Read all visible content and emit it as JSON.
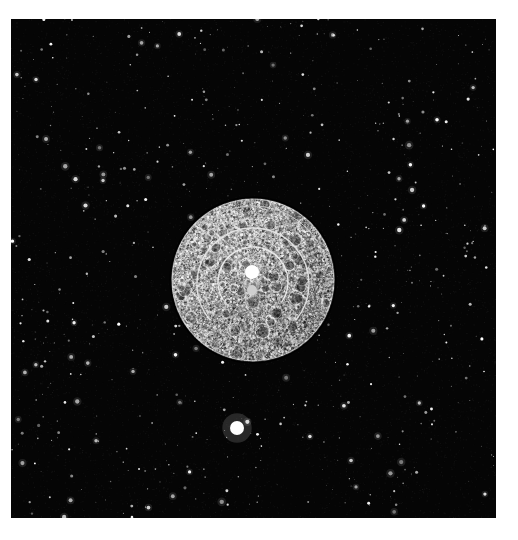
{
  "page": {
    "width": 518,
    "height": 540,
    "background_color": "#ffffff",
    "media_type": "halftone-printed astronomical photograph",
    "caption": ""
  },
  "plate": {
    "name": "moon-star-field-plate",
    "x": 11,
    "y": 19,
    "width": 485,
    "height": 499,
    "sky_color": "#050505",
    "border_color": "#ffffff"
  },
  "scene": {
    "title": "The Moon over a dense star field",
    "objects": [
      {
        "name": "moon",
        "type": "disc",
        "cx": 253,
        "cy": 280,
        "radius": 82,
        "surface": "cratered halftone grayscale",
        "highlight_color": "#e8e8e8",
        "shadow_color": "#2a2a2a"
      },
      {
        "name": "bright-central-spot",
        "type": "dot",
        "cx": 252,
        "cy": 272,
        "radius": 7,
        "color": "#ffffff"
      },
      {
        "name": "secondary-spot",
        "type": "dot",
        "cx": 252,
        "cy": 290,
        "radius": 5,
        "color": "#cfcfcf"
      },
      {
        "name": "bright-object-below-moon",
        "type": "dot",
        "cx": 237,
        "cy": 428,
        "radius": 7,
        "color": "#ffffff"
      }
    ],
    "arcs": [
      {
        "name": "inner-arc",
        "cx": 253,
        "cy": 282,
        "radius": 35,
        "start_deg": 150,
        "end_deg": 395,
        "color": "#f0f0f0",
        "width": 1.4
      },
      {
        "name": "mid-arc",
        "cx": 253,
        "cy": 284,
        "radius": 56,
        "start_deg": 140,
        "end_deg": 400,
        "color": "#e6e6e6",
        "width": 1.4
      },
      {
        "name": "outer-arc",
        "cx": 253,
        "cy": 282,
        "radius": 76,
        "start_deg": 200,
        "end_deg": 350,
        "color": "#cccccc",
        "width": 1.0
      }
    ],
    "maria": [
      {
        "name": "mare-east",
        "cx": 312,
        "cy": 258,
        "rx": 25,
        "ry": 28,
        "tone": "#3a3a3a",
        "rotation": -15
      },
      {
        "name": "mare-north",
        "cx": 248,
        "cy": 198,
        "rx": 30,
        "ry": 17,
        "tone": "#3f3f3f",
        "rotation": 10
      },
      {
        "name": "mare-northeast",
        "cx": 283,
        "cy": 190,
        "rx": 18,
        "ry": 11,
        "tone": "#414141",
        "rotation": -25
      },
      {
        "name": "terminator-shade",
        "cx": 270,
        "cy": 320,
        "rx": 60,
        "ry": 52,
        "tone": "#4a4a4a",
        "rotation": 0
      }
    ],
    "star_field": {
      "name": "background-stars",
      "count": 620,
      "color": "#ffffff",
      "min_radius": 0.4,
      "max_radius": 2.2,
      "seed": 20240521
    }
  },
  "chart_data": {
    "type": "scatter",
    "title": "The Moon over a dense star field",
    "xlabel": "",
    "ylabel": ""
  }
}
